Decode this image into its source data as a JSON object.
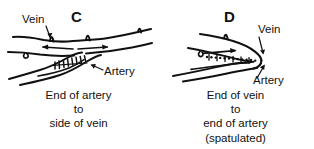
{
  "figure": {
    "width": 314,
    "height": 149,
    "background_color": "#ffffff",
    "ink_color": "#111111",
    "style": "black-and-white line drawing"
  },
  "panels": [
    {
      "id": "C",
      "letter": "C",
      "labels": [
        {
          "name": "vein",
          "text": "Vein",
          "leader": "arrow pointing down-right to upper vessel"
        },
        {
          "name": "artery",
          "text": "Artery",
          "leader": "arrow pointing up-left to lower vessel"
        }
      ],
      "caption": [
        "End of artery",
        "to",
        "side of vein"
      ],
      "flow_arrows": [
        "left",
        "right"
      ],
      "anastomosis": "end-to-side",
      "suture_line": "hatched stitches along junction"
    },
    {
      "id": "D",
      "letter": "D",
      "labels": [
        {
          "name": "vein",
          "text": "Vein",
          "leader": "arrow pointing down-left to vessel apex"
        },
        {
          "name": "artery",
          "text": "Artery",
          "leader": "arrow pointing up-right to lower vessel"
        }
      ],
      "caption": [
        "End of vein",
        "to",
        "end of artery",
        "(spatulated)"
      ],
      "flow_arrows": [
        "right"
      ],
      "anastomosis": "end-to-end spatulated",
      "suture_line": "dotted stitches along junction"
    }
  ]
}
